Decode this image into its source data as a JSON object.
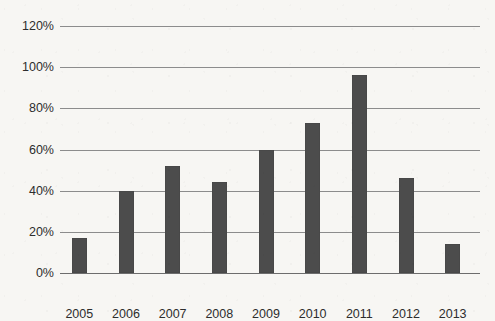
{
  "chart_data": {
    "type": "bar",
    "title": "",
    "subtitle": "",
    "xlabel": "",
    "ylabel": "",
    "categories": [
      "2005",
      "2006",
      "2007",
      "2008",
      "2009",
      "2010",
      "2011",
      "2012",
      "2013"
    ],
    "values": [
      17,
      40,
      52,
      44,
      60,
      73,
      96,
      46,
      14
    ],
    "y_tick_labels": [
      "0%",
      "20%",
      "40%",
      "60%",
      "80%",
      "100%",
      "120%"
    ],
    "y_tick_values": [
      0,
      20,
      40,
      60,
      80,
      100,
      120
    ],
    "ylim": [
      0,
      120
    ],
    "grid": true,
    "legend": false,
    "legend_position": "none",
    "series": [
      {
        "name": "Series 1",
        "values": [
          17,
          40,
          52,
          44,
          60,
          73,
          96,
          46,
          14
        ]
      }
    ]
  },
  "style": {
    "bar_color": "#4c4c4c",
    "grid_color": "#8c8c8c",
    "background_color": "#f7f6f3",
    "text_color": "#2d2d2d"
  }
}
